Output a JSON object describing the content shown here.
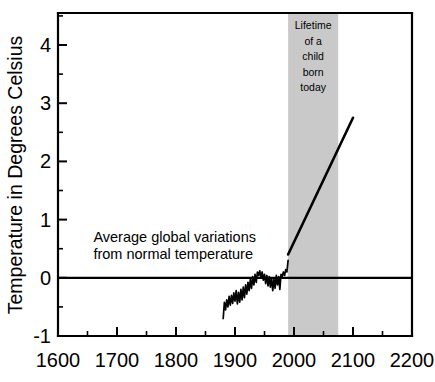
{
  "chart_data": {
    "type": "line",
    "title": "",
    "xlabel": "",
    "ylabel": "Temperature in Degrees Celsius",
    "xlim": [
      1600,
      2200
    ],
    "ylim": [
      -1,
      4.55
    ],
    "grid": false,
    "legend": "none",
    "x_ticks": [
      1600,
      1700,
      1800,
      1900,
      2000,
      2100,
      2200
    ],
    "x_tick_labels": [
      "1600",
      "1700",
      "1800",
      "1900",
      "2000",
      "2100",
      "2200"
    ],
    "x_minor_ticks": [
      1650,
      1750,
      1850,
      1950,
      2050,
      2150
    ],
    "y_ticks": [
      -1,
      0,
      1,
      2,
      3,
      4
    ],
    "y_tick_labels": [
      "-1",
      "0",
      "1",
      "2",
      "3",
      "4"
    ],
    "y_minor_ticks": [
      -0.5,
      0.5,
      1.5,
      2.5,
      3.5,
      4.5
    ],
    "zero_reference_line": 0,
    "series": [
      {
        "name": "Observed global temperature anomaly",
        "style": "jagged-line",
        "color": "#000000",
        "x": [
          1880,
          1882,
          1884,
          1886,
          1888,
          1890,
          1892,
          1894,
          1896,
          1898,
          1900,
          1902,
          1904,
          1906,
          1908,
          1910,
          1912,
          1914,
          1916,
          1918,
          1920,
          1922,
          1924,
          1926,
          1928,
          1930,
          1932,
          1934,
          1936,
          1938,
          1940,
          1942,
          1944,
          1946,
          1948,
          1950,
          1952,
          1954,
          1956,
          1958,
          1960,
          1962,
          1964,
          1966,
          1968,
          1970,
          1972,
          1974,
          1976,
          1978,
          1980,
          1982,
          1984,
          1986,
          1988,
          1990
        ],
        "y": [
          -0.7,
          -0.42,
          -0.55,
          -0.38,
          -0.5,
          -0.32,
          -0.47,
          -0.3,
          -0.44,
          -0.26,
          -0.4,
          -0.22,
          -0.45,
          -0.25,
          -0.42,
          -0.2,
          -0.38,
          -0.16,
          -0.34,
          -0.12,
          -0.28,
          -0.08,
          -0.22,
          -0.02,
          -0.18,
          0.02,
          -0.12,
          0.06,
          -0.08,
          0.1,
          0.04,
          0.12,
          0.0,
          0.1,
          -0.04,
          0.06,
          -0.1,
          0.04,
          -0.14,
          0.02,
          -0.16,
          0.0,
          -0.22,
          -0.02,
          -0.18,
          0.04,
          -0.12,
          0.02,
          -0.2,
          0.06,
          0.02,
          0.1,
          0.04,
          0.14,
          0.1,
          0.3
        ]
      },
      {
        "name": "Projected warming",
        "style": "straight-line",
        "color": "#000000",
        "x": [
          1990,
          2100
        ],
        "y": [
          0.4,
          2.75
        ]
      }
    ],
    "shaded_regions": [
      {
        "name": "Lifetime of a child born today",
        "x_start": 1990,
        "x_end": 2075,
        "color": "#c9c9c9",
        "label_lines": [
          "Lifetime",
          "of a",
          "child",
          "born",
          "today"
        ]
      }
    ],
    "annotations": [
      {
        "name": "average-global-variations-note",
        "lines": [
          "Average global variations",
          "from normal temperature"
        ],
        "x": 1660,
        "y": 0.62
      }
    ]
  },
  "axis": {
    "y_title": "Temperature in Degrees Celsius"
  }
}
